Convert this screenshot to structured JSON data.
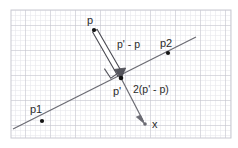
{
  "figure": {
    "background_color": "#ffffff",
    "grid": {
      "minor_spacing_px": 5,
      "major_spacing_px": 25,
      "minor_color": "#e3e3e8",
      "major_color": "#c2c2cb",
      "x": 11,
      "y": 10,
      "width": 220,
      "height": 128
    },
    "stroke_color": "#4a4a52",
    "point_color": "#1a1a1a",
    "text_color": "#2b2b2b"
  },
  "labels": {
    "p": "p",
    "p_prime": "p'",
    "p1": "p1",
    "p2": "p2",
    "x": "x",
    "vector_diff": "p' - p",
    "vector_double": "2(p' - p)"
  },
  "points": {
    "p": {
      "x": 94,
      "y": 30
    },
    "p_prime": {
      "x": 121,
      "y": 78
    },
    "p1": {
      "x": 42,
      "y": 121
    },
    "p2": {
      "x": 168,
      "y": 53
    },
    "x": {
      "x": 145,
      "y": 124
    }
  },
  "line": {
    "name": "mirror-line",
    "x1": 13,
    "y1": 129,
    "x2": 196,
    "y2": 37
  },
  "arrows": [
    {
      "name": "vector-p-to-pprime",
      "style": "double-line",
      "from": "p",
      "to": "p_prime"
    },
    {
      "name": "vector-pprime-to-x",
      "style": "single-line",
      "from": "p_prime",
      "to": "x"
    }
  ],
  "right_angle_marker": {
    "name": "right-angle-marker",
    "size_px": 11
  }
}
